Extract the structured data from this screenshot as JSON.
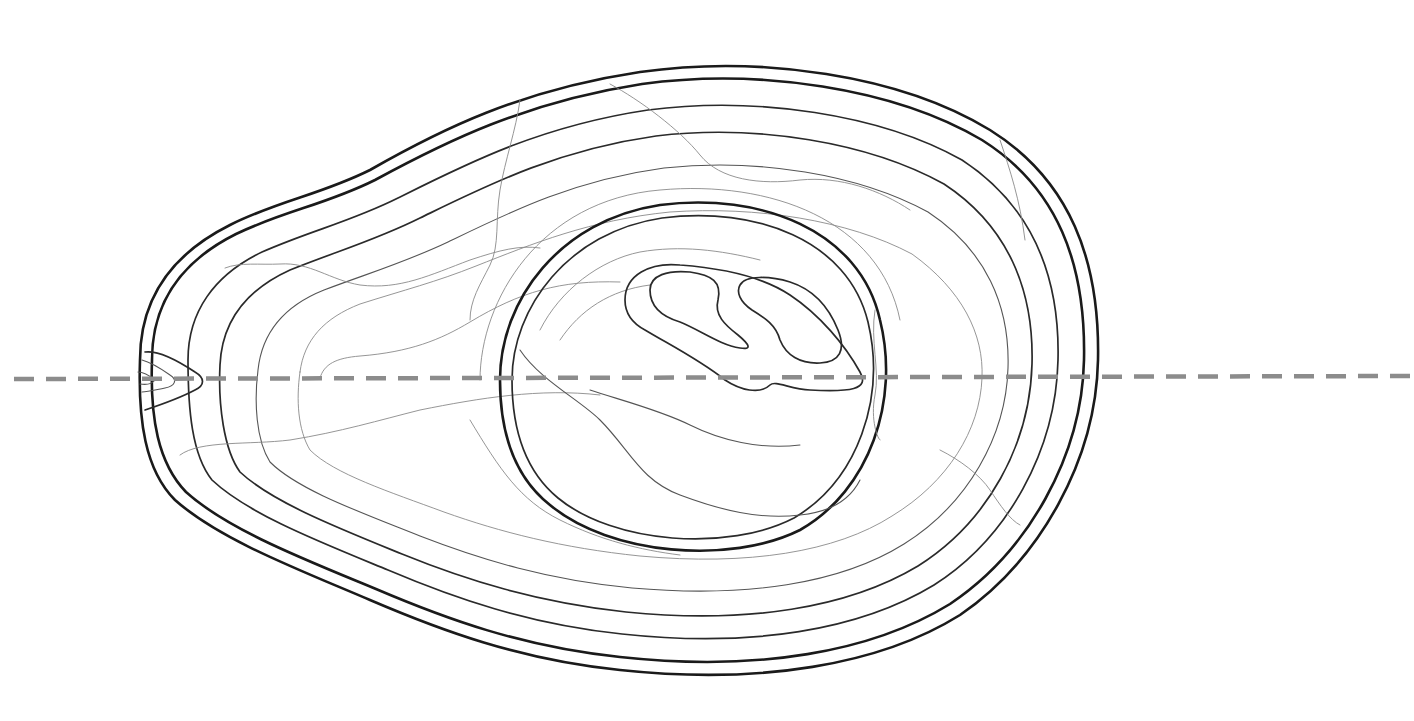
{
  "diagram": {
    "background_color": "#ffffff",
    "line_color": "#1a1a1a",
    "cut_line_color": "#8c8c8c",
    "parts": [
      {
        "id": "outer-skin",
        "style": "thick"
      },
      {
        "id": "inner-skin",
        "style": "thick"
      },
      {
        "id": "flesh-contours",
        "style": "thin"
      },
      {
        "id": "pit-outline",
        "style": "thick"
      },
      {
        "id": "pit-contours",
        "style": "med"
      },
      {
        "id": "stem-end",
        "style": "med"
      },
      {
        "id": "section-cut-line",
        "style": "dashed"
      }
    ]
  }
}
